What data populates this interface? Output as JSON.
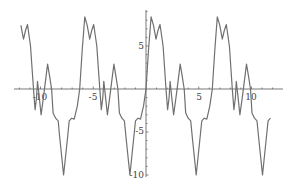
{
  "chart_data": {
    "type": "line",
    "title": "",
    "xlabel": "",
    "ylabel": "",
    "xlim": [
      -12.5,
      12.5
    ],
    "ylim": [
      -10.3,
      8.8
    ],
    "grid": false,
    "legend": null,
    "x_ticks": [
      -10,
      -5,
      5,
      10
    ],
    "y_ticks": [
      -10,
      -5,
      5
    ],
    "x_tick_labels": [
      "-10",
      "-5",
      "5",
      "10"
    ],
    "y_tick_labels": [
      "-10",
      "-5",
      "5"
    ],
    "period": 6.283,
    "series": [
      {
        "name": "f(x)",
        "color": "#707070",
        "one_period_points": [
          [
            0.0,
            0.0
          ],
          [
            0.24,
            4.5
          ],
          [
            0.48,
            8.4
          ],
          [
            0.71,
            7.4
          ],
          [
            0.95,
            5.8
          ],
          [
            1.14,
            6.8
          ],
          [
            1.33,
            7.5
          ],
          [
            1.62,
            5.0
          ],
          [
            1.9,
            0.0
          ],
          [
            2.05,
            -2.4
          ],
          [
            2.19,
            -1.0
          ],
          [
            2.28,
            0.9
          ],
          [
            2.43,
            -0.8
          ],
          [
            2.62,
            -3.0
          ],
          [
            2.86,
            -0.8
          ],
          [
            3.24,
            2.9
          ],
          [
            3.43,
            1.5
          ],
          [
            3.62,
            0.0
          ],
          [
            3.76,
            -2.8
          ],
          [
            4.0,
            -3.4
          ],
          [
            4.24,
            -3.7
          ],
          [
            4.38,
            -5.5
          ],
          [
            4.76,
            -10.0
          ],
          [
            5.14,
            -5.5
          ],
          [
            5.29,
            -3.7
          ],
          [
            5.52,
            -3.4
          ],
          [
            5.76,
            -3.5
          ],
          [
            6.05,
            -2.0
          ],
          [
            6.283,
            0.0
          ]
        ],
        "x_range": [
          -12.0,
          11.9
        ]
      }
    ]
  },
  "axes": {
    "x_labels": [
      "-10",
      "-5",
      "5",
      "10"
    ],
    "y_labels": [
      "5",
      "-5",
      "-10"
    ]
  }
}
